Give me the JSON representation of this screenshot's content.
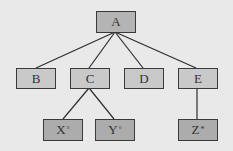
{
  "diagram": {
    "type": "tree",
    "nodes": [
      {
        "id": "A",
        "label": "A",
        "sup": "",
        "level": 0
      },
      {
        "id": "B",
        "label": "B",
        "sup": "",
        "level": 1
      },
      {
        "id": "C",
        "label": "C",
        "sup": "",
        "level": 1
      },
      {
        "id": "D",
        "label": "D",
        "sup": "",
        "level": 1
      },
      {
        "id": "E",
        "label": "E",
        "sup": "",
        "level": 1
      },
      {
        "id": "X",
        "label": "X",
        "sup": "°",
        "level": 2
      },
      {
        "id": "Y",
        "label": "Y",
        "sup": "°",
        "level": 2
      },
      {
        "id": "Z",
        "label": "Z",
        "sup": "*",
        "level": 2
      }
    ],
    "edges": [
      [
        "A",
        "B"
      ],
      [
        "A",
        "C"
      ],
      [
        "A",
        "D"
      ],
      [
        "A",
        "E"
      ],
      [
        "C",
        "X"
      ],
      [
        "C",
        "Y"
      ],
      [
        "E",
        "Z"
      ]
    ],
    "colors": {
      "background": "#e9e9e9",
      "root_fill": "#b4b4b4",
      "mid_fill": "#c9c9c9",
      "leaf_fill": "#acacac",
      "stroke": "#3a3a3a"
    }
  }
}
